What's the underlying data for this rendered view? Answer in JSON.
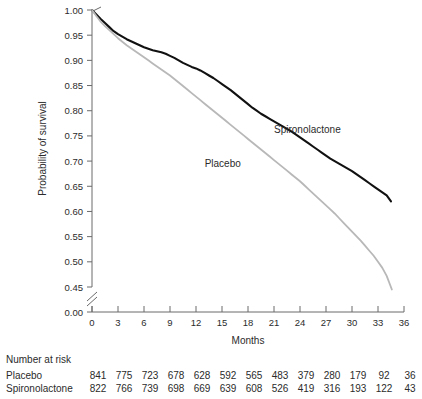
{
  "chart_data": {
    "type": "line",
    "title": "",
    "xlabel": "Months",
    "ylabel": "Probability of survival",
    "xlim": [
      0,
      36
    ],
    "ylim": [
      0.45,
      1.0
    ],
    "y_axis_break": true,
    "y_break_value": "0.00",
    "grid": false,
    "legend_position": "inline-annotations",
    "xticks": [
      "0",
      "3",
      "6",
      "9",
      "12",
      "15",
      "18",
      "21",
      "24",
      "27",
      "30",
      "33",
      "36"
    ],
    "xtick_values": [
      0,
      3,
      6,
      9,
      12,
      15,
      18,
      21,
      24,
      27,
      30,
      33,
      36
    ],
    "yticks": [
      "0.00",
      "0.45",
      "0.50",
      "0.55",
      "0.60",
      "0.65",
      "0.70",
      "0.75",
      "0.80",
      "0.85",
      "0.90",
      "0.95",
      "1.00"
    ],
    "ytick_values": [
      0.0,
      0.45,
      0.5,
      0.55,
      0.6,
      0.65,
      0.7,
      0.75,
      0.8,
      0.85,
      0.9,
      0.95,
      1.0
    ],
    "series": [
      {
        "name": "Spironolactone",
        "color": "#111111",
        "label_x": 21.0,
        "label_y": 0.755,
        "x": [
          0,
          0.5,
          1,
          1.5,
          2,
          2.5,
          3,
          3.5,
          4,
          4.5,
          5,
          5.5,
          6,
          6.5,
          7,
          7.5,
          8,
          8.5,
          9,
          9.5,
          10,
          10.5,
          11,
          11.5,
          12,
          12.5,
          13,
          13.5,
          14,
          14.5,
          15,
          15.5,
          16,
          16.5,
          17,
          17.5,
          18,
          18.5,
          19,
          19.5,
          20,
          20.5,
          21,
          21.5,
          22,
          22.5,
          23,
          23.5,
          24,
          24.5,
          25,
          25.5,
          26,
          26.5,
          27,
          27.5,
          28,
          28.5,
          29,
          29.5,
          30,
          30.5,
          31,
          31.5,
          32,
          32.5,
          33,
          33.5,
          34,
          34.5
        ],
        "y": [
          1.0,
          0.991,
          0.982,
          0.974,
          0.966,
          0.958,
          0.952,
          0.947,
          0.942,
          0.938,
          0.934,
          0.93,
          0.926,
          0.923,
          0.92,
          0.918,
          0.916,
          0.913,
          0.909,
          0.905,
          0.9,
          0.895,
          0.891,
          0.887,
          0.884,
          0.88,
          0.875,
          0.87,
          0.865,
          0.859,
          0.853,
          0.847,
          0.841,
          0.834,
          0.827,
          0.82,
          0.813,
          0.806,
          0.8,
          0.794,
          0.789,
          0.784,
          0.779,
          0.774,
          0.769,
          0.764,
          0.759,
          0.753,
          0.747,
          0.741,
          0.735,
          0.729,
          0.723,
          0.717,
          0.711,
          0.705,
          0.7,
          0.695,
          0.69,
          0.685,
          0.68,
          0.674,
          0.668,
          0.662,
          0.656,
          0.65,
          0.644,
          0.638,
          0.632,
          0.62
        ]
      },
      {
        "name": "Placebo",
        "color": "#b8b8b8",
        "label_x": 13.0,
        "label_y": 0.688,
        "x": [
          0,
          0.5,
          1,
          1.5,
          2,
          2.5,
          3,
          3.5,
          4,
          4.5,
          5,
          5.5,
          6,
          6.5,
          7,
          7.5,
          8,
          8.5,
          9,
          9.5,
          10,
          10.5,
          11,
          11.5,
          12,
          12.5,
          13,
          13.5,
          14,
          14.5,
          15,
          15.5,
          16,
          16.5,
          17,
          17.5,
          18,
          18.5,
          19,
          19.5,
          20,
          20.5,
          21,
          21.5,
          22,
          22.5,
          23,
          23.5,
          24,
          24.5,
          25,
          25.5,
          26,
          26.5,
          27,
          27.5,
          28,
          28.5,
          29,
          29.5,
          30,
          30.5,
          31,
          31.5,
          32,
          32.5,
          33,
          33.5,
          34,
          34.6
        ],
        "y": [
          1.0,
          0.988,
          0.977,
          0.968,
          0.96,
          0.952,
          0.944,
          0.937,
          0.93,
          0.924,
          0.918,
          0.912,
          0.906,
          0.9,
          0.894,
          0.888,
          0.882,
          0.876,
          0.87,
          0.863,
          0.856,
          0.849,
          0.842,
          0.835,
          0.828,
          0.821,
          0.814,
          0.807,
          0.8,
          0.793,
          0.786,
          0.779,
          0.772,
          0.765,
          0.758,
          0.751,
          0.744,
          0.737,
          0.73,
          0.723,
          0.716,
          0.709,
          0.702,
          0.695,
          0.688,
          0.681,
          0.674,
          0.667,
          0.66,
          0.652,
          0.644,
          0.636,
          0.628,
          0.62,
          0.612,
          0.604,
          0.596,
          0.587,
          0.578,
          0.569,
          0.56,
          0.551,
          0.542,
          0.532,
          0.522,
          0.512,
          0.5,
          0.488,
          0.472,
          0.445
        ]
      }
    ]
  },
  "risk_table": {
    "title": "Number at risk",
    "rows": [
      {
        "label": "Placebo",
        "values": [
          "841",
          "775",
          "723",
          "678",
          "628",
          "592",
          "565",
          "483",
          "379",
          "280",
          "179",
          "92",
          "36"
        ]
      },
      {
        "label": "Spironolactone",
        "values": [
          "822",
          "766",
          "739",
          "698",
          "669",
          "639",
          "608",
          "526",
          "419",
          "316",
          "193",
          "122",
          "43"
        ]
      }
    ]
  }
}
